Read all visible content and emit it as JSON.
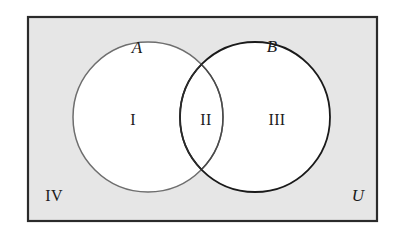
{
  "figure": {
    "name": "venn-diagram-two-sets",
    "background_color": "#ffffff",
    "universe_fill": "#e6e6e6",
    "universe_border_color": "#2b2b2b",
    "circle_fill": "#ffffff",
    "circle_a_stroke": "#6e6e6e",
    "circle_b_stroke": "#1a1a1a",
    "label_color": "#1b1b1b"
  },
  "labels": {
    "set_a": "A",
    "set_b": "B",
    "universe": "U",
    "region_one": "I",
    "region_two": "II",
    "region_three": "III",
    "region_four": "IV"
  },
  "geometry": {
    "rect": {
      "x": 27,
      "y": 16,
      "width": 351,
      "height": 206
    },
    "circle_a": {
      "cx": 148,
      "cy": 117,
      "r": 75
    },
    "circle_b": {
      "cx": 255,
      "cy": 117,
      "r": 75
    }
  }
}
